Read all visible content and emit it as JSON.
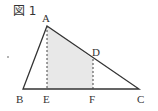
{
  "figure": {
    "title": "図 1",
    "points": {
      "A": {
        "label": "A",
        "x": 47,
        "y": 26
      },
      "B": {
        "label": "B",
        "x": 23,
        "y": 89
      },
      "C": {
        "label": "C",
        "x": 139,
        "y": 89
      },
      "D": {
        "label": "D",
        "x": 93,
        "y": 59
      },
      "E": {
        "label": "E",
        "x": 47,
        "y": 89
      },
      "F": {
        "label": "F",
        "x": 93,
        "y": 89
      }
    },
    "shaded_region": "AEFD",
    "colors": {
      "line": "#333333",
      "shade": "#e8e8e8",
      "dashed": "#444444"
    }
  }
}
